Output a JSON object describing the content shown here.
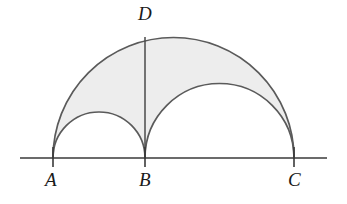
{
  "figure": {
    "canvas": {
      "width": 347,
      "height": 204,
      "background": "#ffffff"
    },
    "colors": {
      "stroke": "#555555",
      "baseline_stroke": "#3a3a3a",
      "shade_fill": "#ededed",
      "label_color": "#1a1a1a"
    },
    "baseline": {
      "name": "horizontal-line",
      "y": 158,
      "x_start": 20,
      "x_end": 327
    },
    "points": [
      {
        "id": "A",
        "label": "A",
        "x": 53,
        "y": 158
      },
      {
        "id": "B",
        "label": "B",
        "x": 145,
        "y": 158
      },
      {
        "id": "C",
        "label": "C",
        "x": 294,
        "y": 158
      },
      {
        "id": "D",
        "label": "D",
        "x": 145,
        "y": 37
      }
    ],
    "segments": [
      {
        "id": "BD",
        "from": "B",
        "to": "D",
        "x1": 145,
        "y1": 158,
        "x2": 145,
        "y2": 37
      }
    ],
    "arcs": [
      {
        "id": "arc-AC",
        "name": "large-semicircle-AC",
        "diameter_endpoints": [
          "A",
          "C"
        ],
        "center_x": 173.5,
        "center_y": 158,
        "radius": 120.5,
        "apex_y": 37.5
      },
      {
        "id": "arc-AB",
        "name": "small-semicircle-AB",
        "diameter_endpoints": [
          "A",
          "B"
        ],
        "center_x": 99,
        "center_y": 158,
        "radius": 46,
        "apex_y": 112
      },
      {
        "id": "arc-BC",
        "name": "medium-semicircle-BC",
        "diameter_endpoints": [
          "B",
          "C"
        ],
        "center_x": 219.5,
        "center_y": 158,
        "radius": 74.5,
        "apex_y": 83.5
      }
    ],
    "shaded_region": {
      "name": "arbelos-shaded-area",
      "description": "Region inside semicircle AC and outside semicircles AB and BC",
      "fill": "#ededed",
      "path": "M 53 158 A 120.5 120.5 0 0 1 294 158 L 294 158 A 74.5 74.5 0 0 0 145 158 A 46 46 0 0 0 53 158 Z"
    },
    "ticks": [
      {
        "id": "tick-A",
        "x": 53,
        "y_top": 148,
        "y_bottom": 166
      },
      {
        "id": "tick-B",
        "x": 145,
        "y_top": 148,
        "y_bottom": 166
      },
      {
        "id": "tick-C",
        "x": 294,
        "y_top": 148,
        "y_bottom": 166
      }
    ]
  }
}
